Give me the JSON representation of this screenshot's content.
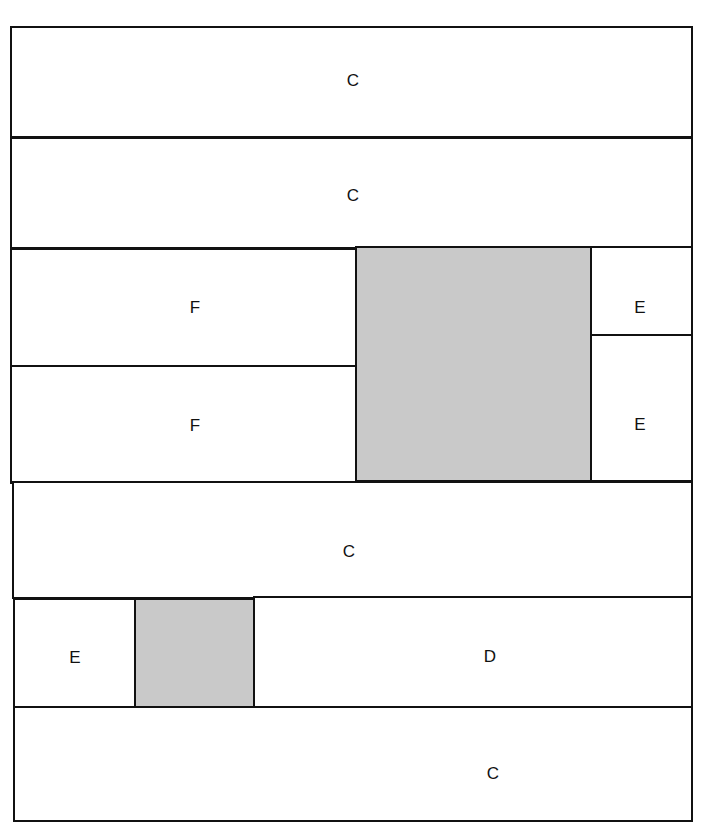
{
  "diagram": {
    "colors": {
      "line": "#111111",
      "background": "#ffffff",
      "shaded": "#c9c9c9"
    },
    "cells": [
      {
        "id": "row1-c",
        "label": "C",
        "x": 10,
        "y": 26,
        "w": 683,
        "h": 112,
        "shaded": false,
        "label_x": 353,
        "label_y": 80
      },
      {
        "id": "row2-c",
        "label": "C",
        "x": 10,
        "y": 137,
        "w": 683,
        "h": 112,
        "shaded": false,
        "label_x": 353,
        "label_y": 195
      },
      {
        "id": "row3-f1",
        "label": "F",
        "x": 10,
        "y": 248,
        "w": 347,
        "h": 119,
        "shaded": false,
        "label_x": 195,
        "label_y": 307
      },
      {
        "id": "row3-f2",
        "label": "F",
        "x": 10,
        "y": 365,
        "w": 349,
        "h": 119,
        "shaded": false,
        "label_x": 195,
        "label_y": 425
      },
      {
        "id": "block-large",
        "label": "",
        "x": 355,
        "y": 246,
        "w": 237,
        "h": 236,
        "shaded": true
      },
      {
        "id": "row3-e1",
        "label": "E",
        "x": 589,
        "y": 246,
        "w": 104,
        "h": 90,
        "shaded": false,
        "label_x": 640,
        "label_y": 307
      },
      {
        "id": "row3-e2",
        "label": "E",
        "x": 589,
        "y": 334,
        "w": 104,
        "h": 148,
        "shaded": false,
        "label_x": 640,
        "label_y": 424
      },
      {
        "id": "row4-c",
        "label": "C",
        "x": 12,
        "y": 481,
        "w": 681,
        "h": 118,
        "shaded": false,
        "label_x": 349,
        "label_y": 551
      },
      {
        "id": "row5-e",
        "label": "E",
        "x": 13,
        "y": 598,
        "w": 123,
        "h": 113,
        "shaded": false,
        "label_x": 75,
        "label_y": 657
      },
      {
        "id": "block-small",
        "label": "",
        "x": 134,
        "y": 598,
        "w": 121,
        "h": 112,
        "shaded": true
      },
      {
        "id": "row5-d",
        "label": "D",
        "x": 253,
        "y": 596,
        "w": 440,
        "h": 112,
        "shaded": false,
        "label_x": 490,
        "label_y": 656
      },
      {
        "id": "row6-c",
        "label": "C",
        "x": 13,
        "y": 706,
        "w": 680,
        "h": 116,
        "shaded": false,
        "label_x": 493,
        "label_y": 773
      }
    ]
  }
}
